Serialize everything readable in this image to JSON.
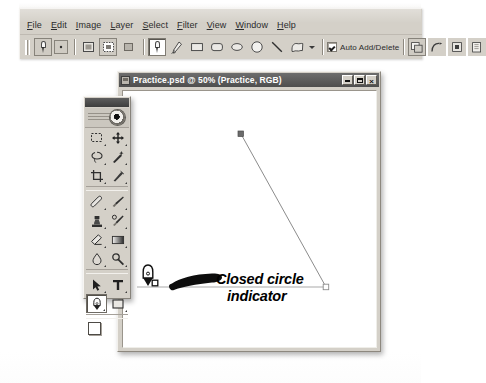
{
  "app": {
    "menus": [
      {
        "pre": "",
        "acc": "F",
        "post": "ile"
      },
      {
        "pre": "",
        "acc": "E",
        "post": "dit"
      },
      {
        "pre": "",
        "acc": "I",
        "post": "mage"
      },
      {
        "pre": "",
        "acc": "L",
        "post": "ayer"
      },
      {
        "pre": "",
        "acc": "S",
        "post": "elect"
      },
      {
        "pre": "",
        "acc": "F",
        "post": "ilter"
      },
      {
        "pre": "",
        "acc": "V",
        "post": "iew"
      },
      {
        "pre": "",
        "acc": "W",
        "post": "indow"
      },
      {
        "pre": "",
        "acc": "H",
        "post": "elp"
      }
    ],
    "options_bar": {
      "active_tool": "pen-tool",
      "tool_preset_label": "",
      "mode_buttons": [
        "shape-layers",
        "paths",
        "fill-pixels"
      ],
      "shape_buttons": [
        "pen-tool",
        "freeform-pen-tool",
        "rectangle-tool",
        "rounded-rectangle-tool",
        "ellipse-tool",
        "circle-tool",
        "line-tool",
        "custom-shape-tool"
      ],
      "auto_add_delete_label": "Auto Add/Delete",
      "auto_add_delete_checked": "true",
      "path_area_buttons": [
        "add-to-path-area",
        "subtract-from-path-area",
        "intersect-path-areas",
        "exclude-overlapping-path-areas"
      ]
    }
  },
  "document": {
    "title": "Practice.psd @ 50% (Practice, RGB)",
    "zoom": "50%",
    "file_name": "Practice.psd",
    "color_mode": "RGB",
    "layer_name": "Practice",
    "window_buttons": [
      "minimize",
      "maximize",
      "close"
    ]
  },
  "toolbox": {
    "title": "",
    "tools": [
      {
        "name": "marquee-tool",
        "selected": "false"
      },
      {
        "name": "move-tool",
        "selected": "false"
      },
      {
        "name": "lasso-tool",
        "selected": "false"
      },
      {
        "name": "magic-wand-tool",
        "selected": "false"
      },
      {
        "name": "crop-tool",
        "selected": "false"
      },
      {
        "name": "slice-tool",
        "selected": "false"
      },
      {
        "name": "healing-brush-tool",
        "selected": "false"
      },
      {
        "name": "brush-tool",
        "selected": "false"
      },
      {
        "name": "clone-stamp-tool",
        "selected": "false"
      },
      {
        "name": "history-brush-tool",
        "selected": "false"
      },
      {
        "name": "eraser-tool",
        "selected": "false"
      },
      {
        "name": "gradient-tool",
        "selected": "false"
      },
      {
        "name": "blur-tool",
        "selected": "false"
      },
      {
        "name": "dodge-tool",
        "selected": "false"
      },
      {
        "name": "path-selection-tool",
        "selected": "false"
      },
      {
        "name": "type-tool",
        "selected": "false"
      },
      {
        "name": "pen-tool",
        "selected": "true"
      },
      {
        "name": "rectangle-shape-tool",
        "selected": "false"
      }
    ],
    "foreground_color": "#ffffff",
    "background_color": "#d8d4cc"
  },
  "annotation": {
    "line1": "Closed circle",
    "line2": "indicator",
    "cursor": "pen-tool-close-path-cursor",
    "pointer": "callout-arrow"
  },
  "path_drawing": {
    "anchors": [
      {
        "name": "anchor-top",
        "x": 118,
        "y": 43,
        "state": "selected-filled"
      },
      {
        "name": "anchor-bottom-right",
        "x": 203,
        "y": 196,
        "state": "unselected-hollow"
      }
    ],
    "segments": [
      {
        "name": "diagonal-segment",
        "from": [
          118,
          43
        ],
        "to": [
          203,
          196
        ]
      },
      {
        "name": "horizontal-segment",
        "from": [
          203,
          196
        ],
        "to": [
          28,
          196
        ]
      }
    ],
    "stroke_color": "#8c8c8c"
  },
  "colors": {
    "chrome": "#d4d0c8",
    "titlebar_active": "#4e4e4e",
    "canvas": "#ffffff",
    "path_stroke": "#8c8c8c",
    "text": "#000000"
  }
}
